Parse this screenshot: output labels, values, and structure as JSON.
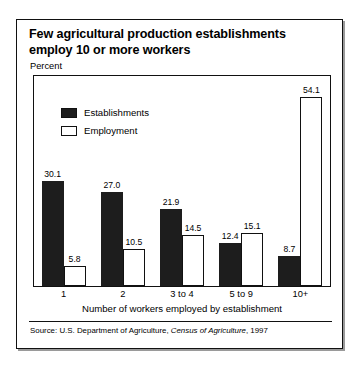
{
  "title": "Few agricultural production establishments employ 10 or more workers",
  "axis": {
    "y_caption": "Percent",
    "x_title": "Number of workers employed by establishment"
  },
  "legend": {
    "position": "top-left-inside-plot",
    "items": [
      {
        "label": "Establishments",
        "swatch": "filled-dark-square",
        "color": "#1d1d1d"
      },
      {
        "label": "Employment",
        "swatch": "outlined-white-square",
        "color": "#ffffff"
      }
    ]
  },
  "source": {
    "prefix": "Source: U.S. Department of Agriculture, ",
    "publication": "Census of Agriculture",
    "suffix": ", 1997"
  },
  "chart_data": {
    "type": "bar",
    "title": "Few agricultural production establishments employ 10 or more workers",
    "subtitle": "",
    "xlabel": "Number of workers employed by establishment",
    "ylabel": "Percent",
    "ylim": [
      0,
      60
    ],
    "grid": false,
    "legend_position": "upper left",
    "categories": [
      "1",
      "2",
      "3 to 4",
      "5 to 9",
      "10+"
    ],
    "series": [
      {
        "name": "Establishments",
        "color": "#1d1d1d",
        "values": [
          30.1,
          27.0,
          21.9,
          12.4,
          8.7
        ],
        "labels": [
          "30.1",
          "27.0",
          "21.9",
          "12.4",
          "8.7"
        ]
      },
      {
        "name": "Employment",
        "color": "#ffffff",
        "values": [
          5.8,
          10.5,
          14.5,
          15.1,
          54.1
        ],
        "labels": [
          "5.8",
          "10.5",
          "14.5",
          "15.1",
          "54.1"
        ]
      }
    ],
    "annotations": []
  }
}
